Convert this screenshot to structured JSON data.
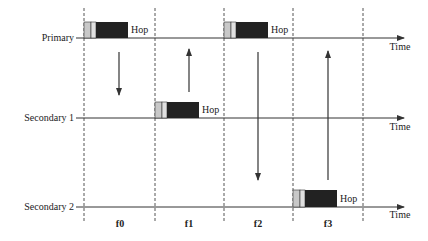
{
  "diagram": {
    "type": "frequency-hopping-timing",
    "rows": [
      {
        "label": "Primary",
        "axis_label": "Time"
      },
      {
        "label": "Secondary 1",
        "axis_label": "Time"
      },
      {
        "label": "Secondary 2",
        "axis_label": "Time"
      }
    ],
    "slots": [
      "f0",
      "f1",
      "f2",
      "f3"
    ],
    "packets": [
      {
        "row": "Primary",
        "slot": "f0",
        "label": "Hop"
      },
      {
        "row": "Secondary 1",
        "slot": "f1",
        "label": "Hop"
      },
      {
        "row": "Primary",
        "slot": "f2",
        "label": "Hop"
      },
      {
        "row": "Secondary 2",
        "slot": "f3",
        "label": "Hop"
      }
    ],
    "arrows": [
      {
        "slot": "f0",
        "direction": "down",
        "from": "Primary",
        "to": "Secondary 1"
      },
      {
        "slot": "f1",
        "direction": "up",
        "from": "Secondary 1",
        "to": "Primary"
      },
      {
        "slot": "f2",
        "direction": "down",
        "from": "Primary",
        "to": "Secondary 2"
      },
      {
        "slot": "f3",
        "direction": "up",
        "from": "Secondary 2",
        "to": "Primary"
      }
    ],
    "colors": {
      "packet_dark": "#222222",
      "packet_light": "#bbbbbb",
      "line": "#333333"
    }
  }
}
